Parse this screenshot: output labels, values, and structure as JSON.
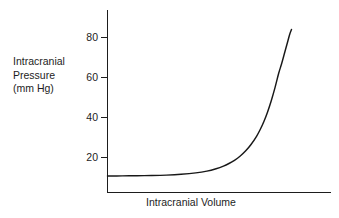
{
  "chart_data": {
    "type": "line",
    "title": "",
    "xlabel": "Intracranial Volume",
    "ylabel_lines": [
      "Intracranial",
      "Pressure",
      "(mm Hg)"
    ],
    "ylabel": "Intracranial Pressure (mm Hg)",
    "yticks": [
      20,
      40,
      60,
      80
    ],
    "ytick_labels": [
      "20",
      "40",
      "60",
      "80"
    ],
    "xticks": [],
    "xtick_labels": [],
    "ylim": [
      0,
      92
    ],
    "xlim": [
      0,
      100
    ],
    "grid": false,
    "legend": false,
    "legend_position": "none",
    "series": [
      {
        "name": "intracranial-compliance-curve",
        "color": "#181818",
        "x": [
          0,
          8,
          16,
          24,
          32,
          40,
          48,
          54,
          59,
          63,
          66,
          69,
          72,
          75,
          78,
          81,
          83,
          85,
          87,
          89,
          91,
          93,
          94.5,
          96,
          97.5,
          99,
          100
        ],
        "y": [
          10.8,
          10.8,
          10.9,
          11.0,
          11.2,
          11.6,
          12.3,
          13.2,
          14.4,
          15.7,
          17.0,
          18.6,
          20.6,
          23.2,
          26.5,
          30.6,
          34.0,
          38.0,
          42.8,
          48.4,
          54.8,
          62.0,
          66.5,
          71.5,
          76.5,
          81.5,
          84.0
        ]
      }
    ],
    "axis_color": "#1d1d1d",
    "background_color": "#ffffff"
  },
  "axes": {
    "y_axis_name": "pressure-axis",
    "x_axis_name": "volume-axis"
  }
}
